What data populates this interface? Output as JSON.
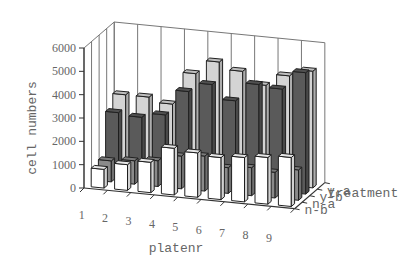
{
  "chart_data": {
    "type": "bar",
    "subtype": "3d-column",
    "title": "",
    "xlabel": "platenr",
    "ylabel": "cell numbers",
    "zlabel": "treatment",
    "ylim": [
      0,
      6000
    ],
    "yticks": [
      0,
      1000,
      2000,
      3000,
      4000,
      5000,
      6000
    ],
    "categories": [
      "1",
      "2",
      "3",
      "4",
      "5",
      "6",
      "7",
      "8",
      "9"
    ],
    "series": [
      {
        "name": "n-b",
        "color": "#ffffff",
        "values": [
          800,
          1100,
          1300,
          2000,
          1900,
          1800,
          1900,
          2000,
          2100
        ]
      },
      {
        "name": "n-a",
        "color": "#8a8a8a",
        "values": [
          900,
          1000,
          1100,
          1400,
          1500,
          1100,
          1200,
          1100,
          1300
        ]
      },
      {
        "name": "y-b",
        "color": "#5a5a5a",
        "values": [
          2700,
          2600,
          2800,
          3900,
          4300,
          3700,
          4500,
          4400,
          5200
        ]
      },
      {
        "name": "y-a",
        "color": "#d4d4d4",
        "values": [
          3200,
          3200,
          3000,
          4400,
          5000,
          4700,
          4200,
          4700,
          5000
        ]
      }
    ],
    "grid": true,
    "legend": "none (series labeled on depth axis)"
  }
}
